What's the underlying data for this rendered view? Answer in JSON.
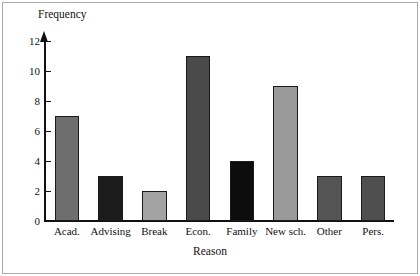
{
  "chart_data": {
    "type": "bar",
    "title": "",
    "categories": [
      "Acad.",
      "Advising",
      "Break",
      "Econ.",
      "Family",
      "New sch.",
      "Other",
      "Pers."
    ],
    "values": [
      7,
      3,
      2,
      11,
      4,
      9,
      3,
      3
    ],
    "xlabel": "Reason",
    "ylabel": "Frequency",
    "ylim": [
      0,
      12
    ],
    "yticks": [
      0,
      2,
      4,
      6,
      8,
      10,
      12
    ],
    "ytick_labels": [
      "0",
      "2",
      "4",
      "6",
      "8",
      "10",
      "12"
    ],
    "grid": false,
    "legend": false,
    "bar_colors": [
      "#6e6e6e",
      "#1c1c1c",
      "#a3a3a3",
      "#4a4a4a",
      "#0d0d0d",
      "#9a9a9a",
      "#545454",
      "#4f4f4f"
    ],
    "bar_edge_color": "#1a1a1a",
    "axis_color": "#111111",
    "background": "#ffffff",
    "frame_color": "#aaaaaa",
    "y_axis_has_arrow": true
  }
}
